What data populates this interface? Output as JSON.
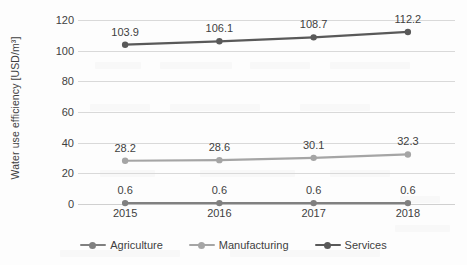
{
  "chart_data": {
    "type": "line",
    "title": "",
    "xlabel": "",
    "ylabel": "Water use efficiency [USD/m³]",
    "categories": [
      "2015",
      "2016",
      "2017",
      "2018"
    ],
    "ylim": [
      0,
      120
    ],
    "yticks": [
      0,
      20,
      40,
      60,
      80,
      100,
      120
    ],
    "ytick_labels": [
      "0",
      "20",
      "40",
      "60",
      "80",
      "100",
      "120"
    ],
    "grid": true,
    "legend_position": "bottom",
    "show_data_labels": true,
    "series": [
      {
        "name": "Agriculture",
        "color": "#808080",
        "values": [
          0.6,
          0.6,
          0.6,
          0.6
        ],
        "labels": [
          "0.6",
          "0.6",
          "0.6",
          "0.6"
        ]
      },
      {
        "name": "Manufacturing",
        "color": "#a5a5a5",
        "values": [
          28.2,
          28.6,
          30.1,
          32.3
        ],
        "labels": [
          "28.2",
          "28.6",
          "30.1",
          "32.3"
        ]
      },
      {
        "name": "Services",
        "color": "#595959",
        "values": [
          103.9,
          106.1,
          108.7,
          112.2
        ],
        "labels": [
          "103.9",
          "106.1",
          "108.7",
          "112.2"
        ]
      }
    ]
  },
  "colors": {
    "background": "#fdfdfd",
    "gridline": "#d9d9d9",
    "text": "#3f3f3f",
    "agriculture": "#808080",
    "manufacturing": "#a5a5a5",
    "services": "#595959"
  }
}
